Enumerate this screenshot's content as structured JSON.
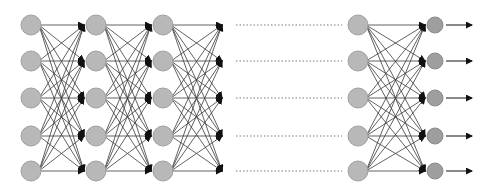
{
  "diagram": {
    "type": "fully-connected-neural-network",
    "colors": {
      "background": "#ffffff",
      "hidden_node_fill": "#b8b8b8",
      "hidden_node_stroke": "#a0a0a0",
      "output_node_fill": "#9e9e9e",
      "output_node_stroke": "#8c8c8c",
      "edge": "#3a3a3a",
      "arrowhead": "#111111",
      "dotted_line": "#7a7a7a"
    },
    "rows_y": [
      25,
      61,
      98,
      136,
      171
    ],
    "layers": [
      {
        "name": "layer-1",
        "x": 31,
        "r": 10,
        "kind": "hidden"
      },
      {
        "name": "layer-2",
        "x": 96,
        "r": 10,
        "kind": "hidden"
      },
      {
        "name": "layer-3",
        "x": 163,
        "r": 10,
        "kind": "hidden"
      },
      {
        "name": "layer-n-minus-1",
        "x": 358,
        "r": 10,
        "kind": "hidden"
      },
      {
        "name": "output-layer",
        "x": 435,
        "r": 8,
        "kind": "output"
      }
    ],
    "connections": [
      {
        "from_layer": 0,
        "to_layer": 1
      },
      {
        "from_layer": 1,
        "to_layer": 2
      },
      {
        "from_layer": 2,
        "to_x": 222
      },
      {
        "from_layer": 3,
        "to_layer": 4
      }
    ],
    "ellipsis_lines": {
      "x1": 236,
      "x2": 342,
      "style": "dotted"
    },
    "output_arrows": {
      "x1": 446,
      "x2": 472
    }
  }
}
